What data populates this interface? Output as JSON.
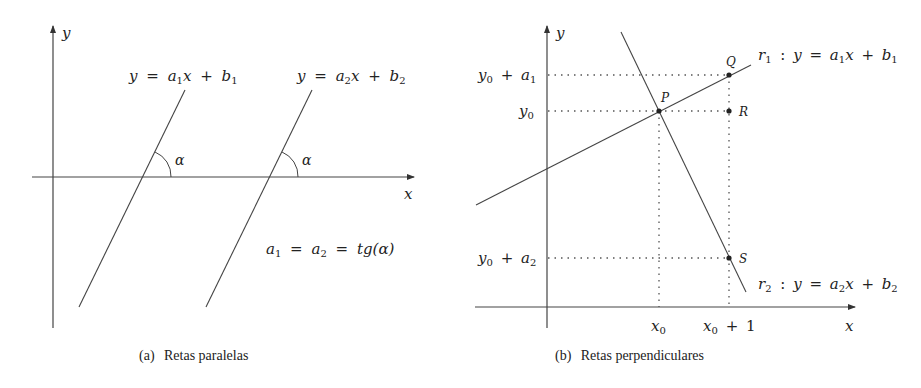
{
  "figure_a": {
    "caption_tag": "(a)",
    "caption_text": "Retas paralelas",
    "axis_x_label": "x",
    "axis_y_label": "y",
    "line1_label": {
      "y": "y",
      "eq": "=",
      "a": "a",
      "sub": "1",
      "x": "x",
      "plus": "+",
      "b": "b",
      "bsub": "1"
    },
    "line2_label": {
      "y": "y",
      "eq": "=",
      "a": "a",
      "sub": "2",
      "x": "x",
      "plus": "+",
      "b": "b",
      "bsub": "2"
    },
    "angle_label": "α",
    "relation": {
      "a1": "a",
      "s1": "1",
      "eq": "=",
      "a2": "a",
      "s2": "2",
      "eq2": "=",
      "rhs": "tg(α)"
    }
  },
  "figure_b": {
    "caption_tag": "(b)",
    "caption_text": "Retas perpendiculares",
    "axis_x_label": "x",
    "axis_y_label": "y",
    "points": {
      "P": "P",
      "Q": "Q",
      "R": "R",
      "S": "S"
    },
    "y_ticks": {
      "y0_plus_a1": {
        "base": "y",
        "bsub": "0",
        "op": "+",
        "v": "a",
        "vsub": "1"
      },
      "y0": {
        "base": "y",
        "bsub": "0"
      },
      "y0_plus_a2": {
        "base": "y",
        "bsub": "0",
        "op": "+",
        "v": "a",
        "vsub": "2"
      }
    },
    "x_ticks": {
      "x0": {
        "base": "x",
        "bsub": "0"
      },
      "x0_plus_1": {
        "base": "x",
        "bsub": "0",
        "op": "+",
        "v": "1"
      }
    },
    "r1_label": {
      "r": "r",
      "rsub": "1",
      "colon": ":",
      "y": "y",
      "eq": "=",
      "a": "a",
      "sub": "1",
      "x": "x",
      "plus": "+",
      "b": "b",
      "bsub": "1"
    },
    "r2_label": {
      "r": "r",
      "rsub": "2",
      "colon": ":",
      "y": "y",
      "eq": "=",
      "a": "a",
      "sub": "2",
      "x": "x",
      "plus": "+",
      "b": "b",
      "bsub": "2"
    }
  }
}
